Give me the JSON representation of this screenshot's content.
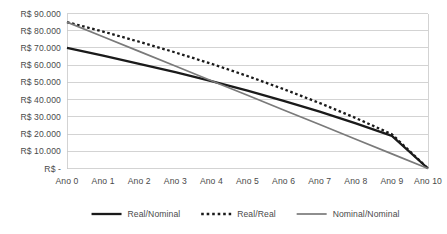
{
  "chart_data": {
    "type": "line",
    "title": "",
    "xlabel": "",
    "ylabel": "",
    "categories": [
      "Ano 0",
      "Ano 1",
      "Ano 2",
      "Ano 3",
      "Ano 4",
      "Ano 5",
      "Ano 6",
      "Ano 7",
      "Ano 8",
      "Ano 9",
      "Ano 10"
    ],
    "x": [
      0,
      1,
      2,
      3,
      4,
      5,
      6,
      7,
      8,
      9,
      10
    ],
    "ylim": [
      0,
      90000
    ],
    "ytick_values": [
      0,
      10000,
      20000,
      30000,
      40000,
      50000,
      60000,
      70000,
      80000,
      90000
    ],
    "ytick_labels": [
      "R$ -",
      "R$ 10.000",
      "R$ 20.000",
      "R$ 30.000",
      "R$ 40.000",
      "R$ 50.000",
      "R$ 60.000",
      "R$ 70.000",
      "R$ 80.000",
      "R$ 90.000"
    ],
    "grid": true,
    "legend_position": "bottom",
    "currency_prefix": "R$",
    "series": [
      {
        "name": "Real/Nominal",
        "style": "solid",
        "color": "#1a1a1a",
        "width": 2.3,
        "values": [
          70000,
          65500,
          60800,
          55900,
          50700,
          45200,
          39300,
          33000,
          26200,
          18900,
          0
        ]
      },
      {
        "name": "Real/Real",
        "style": "dotted",
        "color": "#1a1a1a",
        "width": 2.3,
        "values": [
          85000,
          79500,
          73600,
          67400,
          60800,
          53700,
          46100,
          38000,
          29300,
          19900,
          0
        ]
      },
      {
        "name": "Nominal/Nominal",
        "style": "solid",
        "color": "#7a7a7a",
        "width": 1.7,
        "values": [
          85000,
          76500,
          68000,
          59500,
          51000,
          42500,
          34000,
          25500,
          17000,
          8500,
          0
        ]
      }
    ]
  },
  "legend": {
    "items": [
      {
        "label": "Real/Nominal",
        "swatch": "thick-solid-line-swatch"
      },
      {
        "label": "Real/Real",
        "swatch": "dotted-line-swatch"
      },
      {
        "label": "Nominal/Nominal",
        "swatch": "thin-solid-line-swatch"
      }
    ]
  },
  "colors": {
    "grid": "#c8c8c8",
    "text": "#4a4a4a",
    "series_primary": "#1a1a1a",
    "series_secondary": "#7a7a7a",
    "background": "#ffffff"
  }
}
